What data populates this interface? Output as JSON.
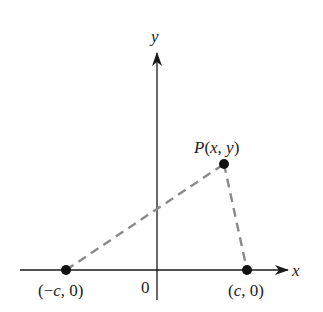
{
  "diagram": {
    "axes": {
      "x_label": "x",
      "y_label": "y",
      "origin_label": "0"
    },
    "points": [
      {
        "id": "left-focus",
        "label": "(−c, 0)",
        "label_parts": [
          "(−",
          "c",
          ", 0)"
        ]
      },
      {
        "id": "right-focus",
        "label": "(c, 0)",
        "label_parts": [
          "(",
          "c",
          ", 0)"
        ]
      },
      {
        "id": "point-p",
        "label": "P(x, y)",
        "label_parts": [
          "P",
          "(",
          "x",
          ", ",
          "y",
          ")"
        ]
      }
    ],
    "segments": [
      {
        "from": "left-focus",
        "to": "point-p",
        "style": "dashed"
      },
      {
        "from": "point-p",
        "to": "right-focus",
        "style": "dashed"
      }
    ],
    "colors": {
      "axis": "#1a1a1a",
      "dash": "#8a8a8a",
      "point": "#111111",
      "text": "#222222"
    }
  }
}
